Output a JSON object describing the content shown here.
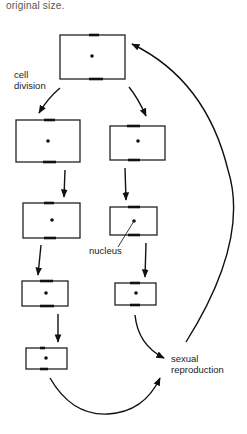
{
  "caption": "original size.",
  "labels": {
    "cell_division_line1": "cell",
    "cell_division_line2": "division",
    "nucleus": "nucleus",
    "sexual_reproduction_line1": "sexual",
    "sexual_reproduction_line2": "reproduction"
  },
  "diagram": {
    "cells": [
      {
        "id": "parent",
        "generation": 0,
        "lineage": "parent"
      },
      {
        "id": "left-1",
        "generation": 1,
        "lineage": "left"
      },
      {
        "id": "right-1",
        "generation": 1,
        "lineage": "right"
      },
      {
        "id": "left-2",
        "generation": 2,
        "lineage": "left"
      },
      {
        "id": "right-2",
        "generation": 2,
        "lineage": "right"
      },
      {
        "id": "left-3",
        "generation": 3,
        "lineage": "left"
      },
      {
        "id": "right-3",
        "generation": 3,
        "lineage": "right"
      },
      {
        "id": "left-4",
        "generation": 4,
        "lineage": "left"
      }
    ],
    "edges": [
      {
        "from": "parent",
        "to": "left-1",
        "label": "cell division"
      },
      {
        "from": "parent",
        "to": "right-1"
      },
      {
        "from": "left-1",
        "to": "left-2"
      },
      {
        "from": "left-2",
        "to": "left-3"
      },
      {
        "from": "left-3",
        "to": "left-4"
      },
      {
        "from": "right-1",
        "to": "right-2"
      },
      {
        "from": "right-2",
        "to": "right-3"
      },
      {
        "from": "right-3",
        "to": "sexual-reproduction"
      },
      {
        "from": "left-4",
        "to": "sexual-reproduction"
      },
      {
        "from": "sexual-reproduction",
        "to": "parent"
      }
    ]
  }
}
